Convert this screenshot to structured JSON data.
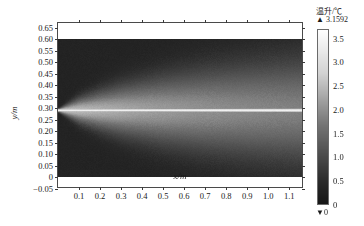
{
  "chart_data": {
    "type": "heatmap",
    "title": "",
    "xlabel": "x/m",
    "ylabel": "y/m",
    "xlim": [
      0.0,
      1.17
    ],
    "ylim": [
      -0.05,
      0.67
    ],
    "data_ylim": [
      0.0,
      0.6
    ],
    "grid": false,
    "xticks": [
      0.1,
      0.2,
      0.3,
      0.4,
      0.5,
      0.6,
      0.7,
      0.8,
      0.9,
      1.0,
      1.1
    ],
    "xtick_labels": [
      "0.1",
      "0.2",
      "0.3",
      "0.4",
      "0.5",
      "0.6",
      "0.7",
      "0.8",
      "0.9",
      "1.0",
      "1.1"
    ],
    "yticks": [
      -0.05,
      0,
      0.05,
      0.1,
      0.15,
      0.2,
      0.25,
      0.3,
      0.35,
      0.4,
      0.45,
      0.5,
      0.55,
      0.6,
      0.65
    ],
    "ytick_labels": [
      "−0.05",
      "0",
      "0.05",
      "0.10",
      "0.15",
      "0.20",
      "0.25",
      "0.30",
      "0.35",
      "0.40",
      "0.45",
      "0.50",
      "0.55",
      "0.60",
      "0.65"
    ],
    "colormap": "gray",
    "source_y": 0.29,
    "source_x": 0.0,
    "plume_half_width_at_x": [
      {
        "x": 0.0,
        "half_width": 0.004
      },
      {
        "x": 0.1,
        "half_width": 0.035
      },
      {
        "x": 0.2,
        "half_width": 0.055
      },
      {
        "x": 0.3,
        "half_width": 0.072
      },
      {
        "x": 0.5,
        "half_width": 0.098
      },
      {
        "x": 0.7,
        "half_width": 0.118
      },
      {
        "x": 0.9,
        "half_width": 0.134
      },
      {
        "x": 1.17,
        "half_width": 0.152
      }
    ],
    "centerline_value": 3.1592,
    "background_value": 0.6
  },
  "colorbar": {
    "title": "温升/℃",
    "max_marker": "▲",
    "max_value": "3.1592",
    "min_marker": "▼",
    "min_value": "0",
    "ticks": [
      3.5,
      3.0,
      2.5,
      2.0,
      1.5,
      1.0,
      0.5,
      0
    ],
    "tick_labels": [
      "3.5",
      "3.0",
      "2.5",
      "2.0",
      "1.5",
      "1.0",
      "0.5",
      "0"
    ],
    "range": [
      0,
      3.7
    ],
    "accent_color": "#f2f2f2",
    "low_color": "#1c1c1c"
  }
}
